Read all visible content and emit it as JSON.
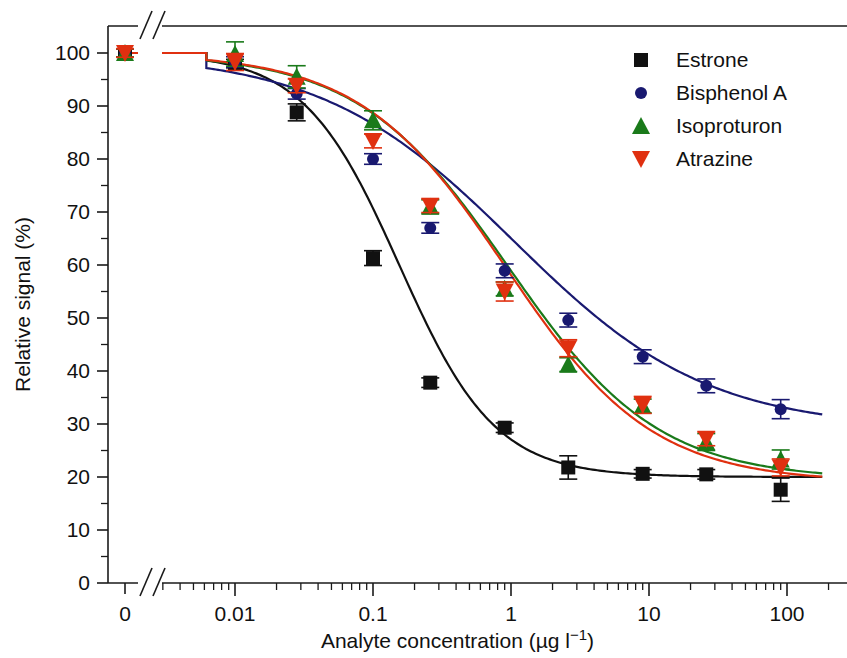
{
  "chart_data": {
    "type": "line",
    "title": "",
    "xlabel": "Analyte concentration (µg l⁻¹)",
    "ylabel": "Relative signal (%)",
    "xscale": "log",
    "x_break": true,
    "x_break_note": "axis break between 0 and 0.005",
    "xticks": [
      "0",
      "0.01",
      "0.1",
      "1",
      "10",
      "100"
    ],
    "xtick_values": [
      0,
      0.01,
      0.1,
      1,
      10,
      100
    ],
    "yticks": [
      "0",
      "10",
      "20",
      "30",
      "40",
      "50",
      "60",
      "70",
      "80",
      "90",
      "100"
    ],
    "ylim": [
      0,
      104
    ],
    "xlim": [
      0.004,
      200
    ],
    "grid": false,
    "legend_position": "top-right",
    "series": [
      {
        "name": "Estrone",
        "color": "#111111",
        "marker": "square",
        "x": [
          0.0,
          0.01,
          0.028,
          0.1,
          0.26,
          0.9,
          2.6,
          9.0,
          26.0,
          90.0
        ],
        "values": [
          100.0,
          98.0,
          88.8,
          61.3,
          37.8,
          29.3,
          21.8,
          20.6,
          20.5,
          17.6
        ],
        "errors": [
          0.8,
          0.8,
          1.6,
          1.4,
          0.9,
          0.9,
          2.2,
          0.8,
          0.9,
          2.2
        ],
        "fit": {
          "top": 100.0,
          "bottom": 20.0,
          "ic50": 0.155,
          "hill": 1.25
        }
      },
      {
        "name": "Bisphenol A",
        "color": "#191970",
        "marker": "circle",
        "x": [
          0.0,
          0.01,
          0.028,
          0.1,
          0.26,
          0.9,
          2.6,
          9.0,
          26.0,
          90.0
        ],
        "values": [
          100.0,
          98.3,
          92.3,
          80.0,
          67.0,
          58.9,
          49.6,
          42.7,
          37.2,
          32.8
        ],
        "errors": [
          0.8,
          1.0,
          1.0,
          1.0,
          1.0,
          1.3,
          1.3,
          1.3,
          1.3,
          1.8
        ],
        "fit": {
          "top": 100.0,
          "bottom": 29.0,
          "ic50": 1.05,
          "hill": 0.62
        }
      },
      {
        "name": "Isoproturon",
        "color": "#1a7a1a",
        "marker": "triangle-up",
        "x": [
          0.0,
          0.01,
          0.028,
          0.1,
          0.26,
          0.9,
          2.6,
          9.0,
          26.0,
          90.0
        ],
        "values": [
          100.0,
          99.8,
          95.5,
          87.3,
          71.0,
          55.5,
          41.2,
          33.4,
          26.6,
          23.3
        ],
        "errors": [
          0.8,
          2.3,
          2.1,
          1.8,
          1.3,
          1.3,
          1.3,
          1.3,
          1.6,
          1.8
        ],
        "fit": {
          "top": 100.0,
          "bottom": 19.5,
          "ic50": 0.95,
          "hill": 0.8
        }
      },
      {
        "name": "Atrazine",
        "color": "#e03010",
        "marker": "triangle-down",
        "x": [
          0.0,
          0.01,
          0.028,
          0.1,
          0.26,
          0.9,
          2.6,
          9.0,
          26.0,
          90.0
        ],
        "values": [
          100.0,
          98.3,
          93.8,
          83.4,
          71.2,
          55.0,
          44.3,
          33.6,
          27.2,
          21.8
        ],
        "errors": [
          0.8,
          1.6,
          1.3,
          1.3,
          1.3,
          1.8,
          1.6,
          1.6,
          1.3,
          1.6
        ],
        "fit": {
          "top": 100.0,
          "bottom": 19.0,
          "ic50": 0.92,
          "hill": 0.82
        }
      }
    ]
  },
  "legend": {
    "entries": [
      {
        "label": "Estrone"
      },
      {
        "label": "Bisphenol A"
      },
      {
        "label": "Isoproturon"
      },
      {
        "label": "Atrazine"
      }
    ]
  }
}
